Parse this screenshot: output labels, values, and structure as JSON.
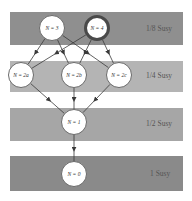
{
  "diagram": {
    "bands": [
      {
        "label": "1/8 Susy",
        "top": 12,
        "height": 33,
        "color": "#8f8f8f"
      },
      {
        "label": "1/4 Susy",
        "top": 61,
        "height": 31,
        "color": "#b4b4b4"
      },
      {
        "label": "1/2 Susy",
        "top": 108,
        "height": 33,
        "color": "#a6a6a6"
      },
      {
        "label": "1 Susy",
        "top": 156,
        "height": 35,
        "color": "#8a8a8a"
      }
    ],
    "nodes": [
      {
        "id": "n3",
        "label": "N = 3",
        "cx": 52,
        "cy": 28,
        "highlight": false
      },
      {
        "id": "n4",
        "label": "N = 4",
        "cx": 97,
        "cy": 28,
        "highlight": true
      },
      {
        "id": "n2a",
        "label": "N = 2a",
        "cx": 21,
        "cy": 75,
        "highlight": false
      },
      {
        "id": "n2b",
        "label": "N = 2b",
        "cx": 74,
        "cy": 75,
        "highlight": false
      },
      {
        "id": "n2c",
        "label": "N = 2c",
        "cx": 119,
        "cy": 75,
        "highlight": false
      },
      {
        "id": "n1",
        "label": "N = 1",
        "cx": 74,
        "cy": 122,
        "highlight": false
      },
      {
        "id": "n0",
        "label": "N = 0",
        "cx": 74,
        "cy": 174,
        "highlight": false
      }
    ],
    "edges": [
      {
        "from": "n3",
        "to": "n2a"
      },
      {
        "from": "n3",
        "to": "n2b"
      },
      {
        "from": "n3",
        "to": "n2c"
      },
      {
        "from": "n4",
        "to": "n2a"
      },
      {
        "from": "n4",
        "to": "n2b"
      },
      {
        "from": "n4",
        "to": "n2c"
      },
      {
        "from": "n2a",
        "to": "n1"
      },
      {
        "from": "n2b",
        "to": "n1"
      },
      {
        "from": "n2c",
        "to": "n1"
      },
      {
        "from": "n1",
        "to": "n0"
      }
    ]
  }
}
